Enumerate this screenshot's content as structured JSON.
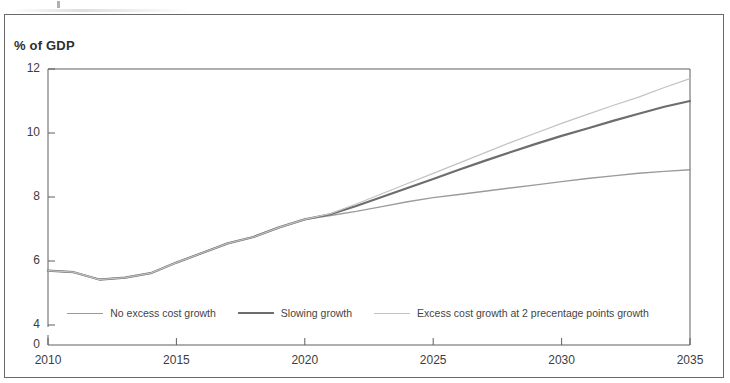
{
  "figure": {
    "y_axis_title": "% of GDP"
  },
  "chart_data": {
    "type": "line",
    "title": "",
    "subtitle": "",
    "xlabel": "",
    "ylabel": "% of GDP",
    "xlim": [
      2010,
      2035
    ],
    "ylim": [
      4,
      12
    ],
    "y_axis_break_below": 4,
    "grid": false,
    "legend_position": "inside-bottom-center",
    "x_ticks": [
      2010,
      2015,
      2020,
      2025,
      2030,
      2035
    ],
    "y_ticks": [
      0,
      4,
      6,
      8,
      10,
      12
    ],
    "x": [
      2010,
      2011,
      2012,
      2013,
      2014,
      2015,
      2016,
      2017,
      2018,
      2019,
      2020,
      2021,
      2022,
      2023,
      2024,
      2025,
      2026,
      2027,
      2028,
      2029,
      2030,
      2031,
      2032,
      2033,
      2034,
      2035
    ],
    "series": [
      {
        "name": "No excess cost growth",
        "color": "#9b9b9b",
        "width": 1.4,
        "values": [
          5.7,
          5.65,
          5.42,
          5.48,
          5.62,
          5.95,
          6.25,
          6.55,
          6.75,
          7.05,
          7.3,
          7.42,
          7.55,
          7.7,
          7.85,
          7.98,
          8.08,
          8.18,
          8.28,
          8.38,
          8.48,
          8.58,
          8.66,
          8.74,
          8.8,
          8.85
        ]
      },
      {
        "name": "Slowing growth",
        "color": "#6d6d6d",
        "width": 2.2,
        "values": [
          5.7,
          5.65,
          5.42,
          5.48,
          5.62,
          5.95,
          6.25,
          6.55,
          6.75,
          7.05,
          7.3,
          7.46,
          7.72,
          8.0,
          8.28,
          8.56,
          8.85,
          9.13,
          9.4,
          9.66,
          9.91,
          10.14,
          10.38,
          10.6,
          10.82,
          11.0
        ]
      },
      {
        "name": "Excess cost growth at 2 precentage points growth",
        "color": "#c2c2c2",
        "width": 1.2,
        "values": [
          5.7,
          5.65,
          5.42,
          5.48,
          5.62,
          5.95,
          6.25,
          6.55,
          6.75,
          7.05,
          7.3,
          7.48,
          7.78,
          8.1,
          8.42,
          8.74,
          9.06,
          9.38,
          9.7,
          10.0,
          10.3,
          10.58,
          10.86,
          11.12,
          11.42,
          11.7
        ]
      }
    ],
    "legend": [
      {
        "label": "No excess cost growth",
        "color": "#9b9b9b"
      },
      {
        "label": "Slowing growth",
        "color": "#6d6d6d"
      },
      {
        "label": "Excess cost growth at 2 precentage points growth",
        "color": "#c2c2c2"
      }
    ]
  }
}
